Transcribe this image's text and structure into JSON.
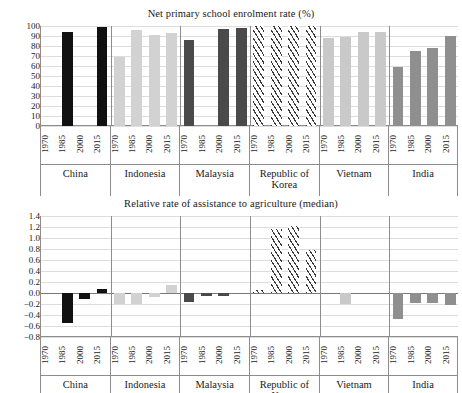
{
  "figure": {
    "countries": [
      "China",
      "Indonesia",
      "Malaysia",
      "Republic of Korea",
      "Vietnam",
      "India"
    ],
    "years": [
      "1970",
      "1985",
      "2000",
      "2015"
    ]
  },
  "chart_data": [
    {
      "type": "bar",
      "title": "Net primary school enrolment rate (%)",
      "xlabel": "",
      "ylabel": "",
      "ylim": [
        0,
        100
      ],
      "yticks": [
        "0",
        "10",
        "20",
        "30",
        "40",
        "50",
        "60",
        "70",
        "80",
        "90",
        "100"
      ],
      "grid": true,
      "legend": "none",
      "categories": [
        "1970",
        "1985",
        "2000",
        "2015"
      ],
      "groups": [
        "China",
        "Indonesia",
        "Malaysia",
        "Republic of Korea",
        "Vietnam",
        "India"
      ],
      "series": [
        {
          "name": "China",
          "fill": "black",
          "values": [
            null,
            94,
            null,
            99
          ]
        },
        {
          "name": "Indonesia",
          "fill": "lighter",
          "values": [
            69,
            96,
            91,
            93
          ]
        },
        {
          "name": "Malaysia",
          "fill": "dark",
          "values": [
            86,
            null,
            97,
            98
          ]
        },
        {
          "name": "Republic of Korea",
          "fill": "hatch",
          "values": [
            100,
            100,
            100,
            100
          ]
        },
        {
          "name": "Vietnam",
          "fill": "light",
          "values": [
            88,
            89,
            94,
            94
          ]
        },
        {
          "name": "India",
          "fill": "mid",
          "values": [
            59,
            75,
            78,
            90
          ]
        }
      ]
    },
    {
      "type": "bar",
      "title": "Relative rate of assistance to agriculture (median)",
      "xlabel": "",
      "ylabel": "",
      "ylim": [
        -0.8,
        1.4
      ],
      "yticks": [
        "1.4",
        "1.2",
        "1.0",
        "0.8",
        "0.6",
        "0.4",
        "0.2",
        "0.0",
        "−0.2",
        "−0.4",
        "−0.6",
        "−0.8"
      ],
      "grid": true,
      "legend": "none",
      "categories": [
        "1970",
        "1985",
        "2000",
        "2015"
      ],
      "groups": [
        "China",
        "Indonesia",
        "Malaysia",
        "Republic of Korea",
        "Vietnam",
        "India"
      ],
      "series": [
        {
          "name": "China",
          "fill": "black",
          "values": [
            null,
            -0.54,
            -0.11,
            0.08
          ]
        },
        {
          "name": "Indonesia",
          "fill": "lighter",
          "values": [
            -0.2,
            -0.2,
            -0.07,
            0.14
          ]
        },
        {
          "name": "Malaysia",
          "fill": "dark",
          "values": [
            -0.17,
            -0.05,
            -0.05,
            null
          ]
        },
        {
          "name": "Republic of Korea",
          "fill": "hatch",
          "values": [
            0.05,
            1.16,
            1.22,
            0.78
          ]
        },
        {
          "name": "Vietnam",
          "fill": "light",
          "values": [
            null,
            -0.2,
            null,
            null
          ]
        },
        {
          "name": "India",
          "fill": "mid",
          "values": [
            -0.47,
            -0.18,
            -0.18,
            -0.22
          ]
        }
      ]
    }
  ],
  "colors": {
    "black": "#111111",
    "lighter": "#d2d2d2",
    "dark": "#4a4a4a",
    "light": "#c9c9c9",
    "mid": "#8f8f8f",
    "hatch": "#3a3a3a",
    "axis": "#8d8d8d",
    "grid": "#dddddd"
  }
}
